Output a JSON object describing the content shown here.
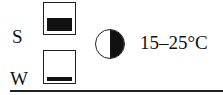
{
  "rows": [
    {
      "label": "S",
      "fill": "large"
    },
    {
      "label": "W",
      "fill": "small"
    }
  ],
  "symbol": {
    "name": "half-shade-icon",
    "meaning": "partial shade"
  },
  "temperature": "15–25°C"
}
